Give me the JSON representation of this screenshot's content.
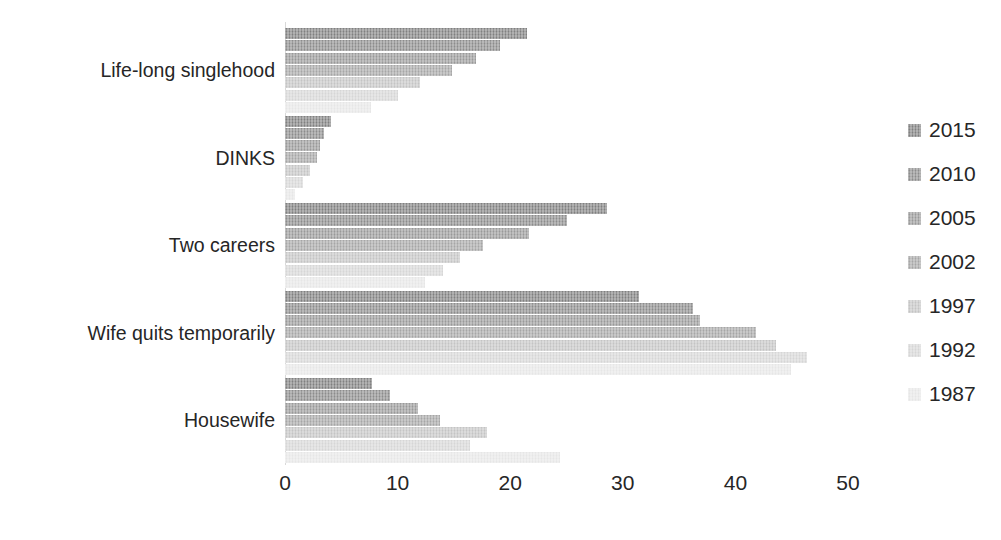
{
  "chart_data": {
    "type": "bar",
    "orientation": "horizontal",
    "title": "",
    "subtitle": "",
    "xlabel": "",
    "ylabel": "",
    "xlim": [
      0,
      50
    ],
    "xticks": [
      0,
      10,
      20,
      30,
      40,
      50
    ],
    "xtick_labels": [
      "0",
      "10",
      "20",
      "30",
      "40",
      "50"
    ],
    "grid": false,
    "legend_position": "right",
    "categories": [
      "Life-long singlehood",
      "DINKS",
      "Two careers",
      "Wife quits temporarily",
      "Housewife"
    ],
    "series": [
      {
        "name": "2015",
        "color": "#808080",
        "values": [
          21.5,
          4.1,
          28.6,
          31.4,
          7.7
        ]
      },
      {
        "name": "2010",
        "color": "#8c8c8c",
        "values": [
          19.1,
          3.5,
          25.0,
          36.2,
          9.3
        ]
      },
      {
        "name": "2005",
        "color": "#999999",
        "values": [
          17.0,
          3.1,
          21.7,
          36.9,
          11.8
        ]
      },
      {
        "name": "2002",
        "color": "#a6a6a6",
        "values": [
          14.8,
          2.8,
          17.6,
          41.8,
          13.8
        ]
      },
      {
        "name": "1997",
        "color": "#c4c4c4",
        "values": [
          12.0,
          2.2,
          15.5,
          43.6,
          17.9
        ]
      },
      {
        "name": "1992",
        "color": "#d6d6d6",
        "values": [
          10.0,
          1.6,
          14.0,
          46.4,
          16.4
        ]
      },
      {
        "name": "1987",
        "color": "#e6e6e6",
        "values": [
          7.6,
          0.9,
          12.4,
          44.9,
          24.4
        ]
      }
    ],
    "legend_entries": [
      "2015",
      "2010",
      "2005",
      "2002",
      "1997",
      "1992",
      "1987"
    ]
  },
  "axis": {
    "x_origin_px": 285,
    "px_per_unit": 11.26
  }
}
